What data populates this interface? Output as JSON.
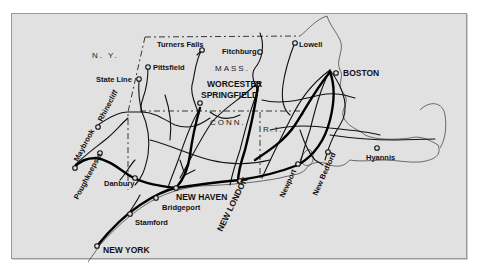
{
  "map": {
    "title": "New England rail network",
    "states": [
      {
        "id": "ny",
        "label": "N. Y."
      },
      {
        "id": "mass",
        "label": "MASS."
      },
      {
        "id": "conn",
        "label": "CONN."
      },
      {
        "id": "ri",
        "label": "R.I."
      }
    ],
    "cities": [
      {
        "id": "turners-falls",
        "label": "Turners Falls",
        "major": false
      },
      {
        "id": "fitchburg",
        "label": "Fitchburg",
        "major": false
      },
      {
        "id": "lowell",
        "label": "Lowell",
        "major": false
      },
      {
        "id": "pittsfield",
        "label": "Pittsfield",
        "major": false
      },
      {
        "id": "state-line",
        "label": "State Line",
        "major": false
      },
      {
        "id": "worcester",
        "label": "WORCESTER",
        "major": true
      },
      {
        "id": "springfield",
        "label": "SPRINGFIELD",
        "major": true
      },
      {
        "id": "boston",
        "label": "BOSTON",
        "major": true
      },
      {
        "id": "rhinecliff",
        "label": "Rhinecliff",
        "major": false
      },
      {
        "id": "maybrook",
        "label": "Maybrook",
        "major": false
      },
      {
        "id": "poughkeepsie",
        "label": "Poughkeepsie",
        "major": false
      },
      {
        "id": "danbury",
        "label": "Danbury",
        "major": false
      },
      {
        "id": "new-haven",
        "label": "NEW HAVEN",
        "major": true
      },
      {
        "id": "bridgeport",
        "label": "Bridgeport",
        "major": false
      },
      {
        "id": "stamford",
        "label": "Stamford",
        "major": false
      },
      {
        "id": "new-york",
        "label": "NEW YORK",
        "major": true
      },
      {
        "id": "new-london",
        "label": "NEW LONDON",
        "major": true
      },
      {
        "id": "newport",
        "label": "Newport",
        "major": false
      },
      {
        "id": "new-bedford",
        "label": "New Bedford",
        "major": false
      },
      {
        "id": "hyannis",
        "label": "Hyannis",
        "major": false
      }
    ]
  }
}
